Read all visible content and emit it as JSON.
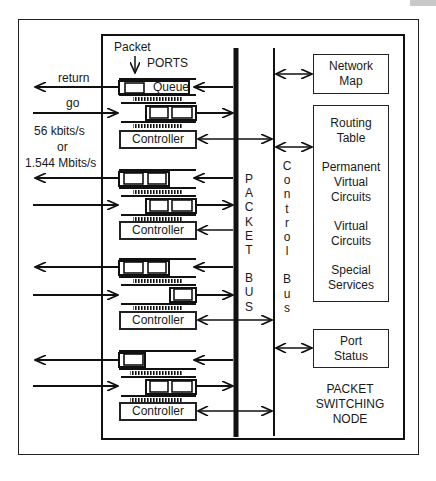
{
  "figure": {
    "title": "Packet Switching Node",
    "colors": {
      "line": "#111111",
      "background": "#ffffff",
      "corner_tab": "#c8c8c8"
    }
  },
  "labels": {
    "packet": "Packet",
    "ports": "PORTS",
    "queue": "Queue",
    "return": "return",
    "go": "go",
    "rate_1": "56 kbits/s",
    "rate_or": "or",
    "rate_2": "1.544 Mbits/s",
    "node_1": "PACKET",
    "node_2": "SWITCHING",
    "node_3": "NODE"
  },
  "ports": [
    {
      "controller": "Controller",
      "out_slots": 1,
      "in_slots": 2
    },
    {
      "controller": "Controller",
      "out_slots": 2,
      "in_slots": 2
    },
    {
      "controller": "Controller",
      "out_slots": 2,
      "in_slots": 1
    },
    {
      "controller": "Controller",
      "out_slots": 1,
      "in_slots": 2
    }
  ],
  "buses": {
    "packet_bus": [
      "P",
      "A",
      "C",
      "K",
      "E",
      "T",
      "",
      "B",
      "U",
      "S"
    ],
    "control_bus": [
      "C",
      "o",
      "n",
      "t",
      "r",
      "o",
      "l",
      "",
      "B",
      "u",
      "s"
    ]
  },
  "right_boxes": {
    "network_map": {
      "line1": "Network",
      "line2": "Map"
    },
    "tables": {
      "routing_1": "Routing",
      "routing_2": "Table",
      "pvc_1": "Permanent",
      "pvc_2": "Virtual",
      "pvc_3": "Circuits",
      "vc_1": "Virtual",
      "vc_2": "Circuits",
      "ss_1": "Special",
      "ss_2": "Services"
    },
    "port_status": {
      "line1": "Port",
      "line2": "Status"
    }
  }
}
